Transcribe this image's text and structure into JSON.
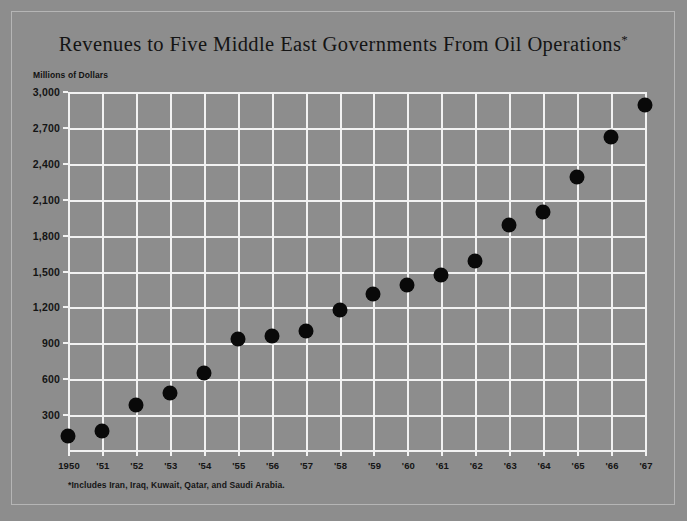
{
  "chart_data": {
    "type": "scatter",
    "title": "Revenues to Five Middle East Governments From Oil Operations*",
    "title_main": "Revenues to Five Middle East Governments From Oil Operations",
    "title_asterisk": "*",
    "ylabel": "Millions of Dollars",
    "xlabel": "",
    "footnote": "*Includes Iran, Iraq, Kuwait, Qatar, and Saudi Arabia.",
    "categories": [
      "1950",
      "'51",
      "'52",
      "'53",
      "'54",
      "'55",
      "'56",
      "'57",
      "'58",
      "'59",
      "'60",
      "'61",
      "'62",
      "'63",
      "'64",
      "'65",
      "'66",
      "'67"
    ],
    "x": [
      1950,
      1951,
      1952,
      1953,
      1954,
      1955,
      1956,
      1957,
      1958,
      1959,
      1960,
      1961,
      1962,
      1963,
      1964,
      1965,
      1966,
      1967
    ],
    "values": [
      125,
      170,
      385,
      485,
      650,
      940,
      965,
      1000,
      1175,
      1310,
      1385,
      1470,
      1590,
      1890,
      2000,
      2290,
      2620,
      2890
    ],
    "ylim": [
      0,
      3000
    ],
    "yticks": [
      300,
      600,
      900,
      1200,
      1500,
      1800,
      2100,
      2400,
      2700,
      3000
    ],
    "ytick_labels": [
      "300",
      "600",
      "900",
      "1,200",
      "1,500",
      "1,800",
      "2,100",
      "2,400",
      "2,700",
      "3,000"
    ],
    "grid": true,
    "legend": "none",
    "marker_color": "#090909",
    "grid_color": "#f2f2f2",
    "background_color": "#8d8d8d",
    "text_color": "#141414"
  }
}
